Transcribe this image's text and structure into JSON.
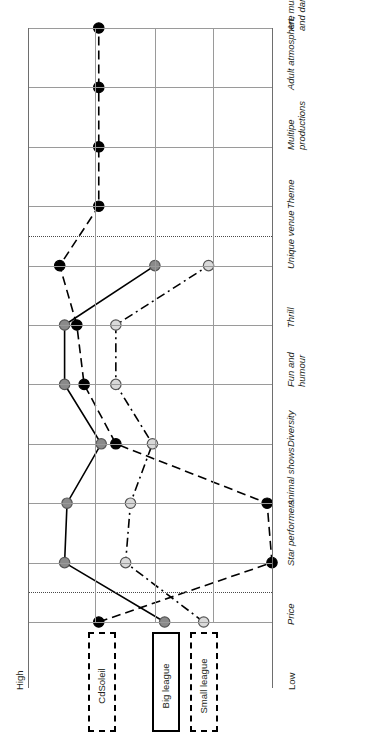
{
  "figure": {
    "axis_low_label": "Low",
    "axis_high_label": "High",
    "orientation": "rotated-90"
  },
  "legend": {
    "items": [
      {
        "label": "CdSoleil",
        "style": "dashed",
        "marker": "black",
        "color": "#000000"
      },
      {
        "label": "Big league",
        "style": "solid",
        "marker": "grey",
        "color": "#8a8a8a"
      },
      {
        "label": "Small league",
        "style": "dash-dot",
        "marker": "lightgrey",
        "color": "#d9d9d9"
      }
    ]
  },
  "chart_data": {
    "type": "line",
    "title": "",
    "xlabel": "",
    "ylabel": "",
    "axis_labels": [
      "High",
      "Low"
    ],
    "grid": true,
    "legend_position": "bottom",
    "categories": [
      "Price",
      "Star performers",
      "Animal shows",
      "Diversity",
      "Fun and humour",
      "Thrill",
      "Unique venue",
      "Theme",
      "Multipe productions",
      "Adult atmosphere",
      "Art, music and dance"
    ],
    "scale": {
      "min": 0,
      "max": 10,
      "note": "0 = High (left edge), 10 = Low (right edge)"
    },
    "series": [
      {
        "name": "CdSoleil",
        "color": "#000000",
        "marker": "filled-black",
        "line_style": "dashed",
        "values": [
          2.9,
          10.0,
          9.8,
          3.6,
          2.3,
          2.0,
          1.3,
          2.9,
          2.9,
          2.9,
          2.9
        ]
      },
      {
        "name": "Big league",
        "color": "#8a8a8a",
        "marker": "filled-grey",
        "line_style": "solid",
        "values": [
          5.6,
          1.5,
          1.6,
          3.0,
          1.5,
          1.5,
          5.2,
          null,
          null,
          null,
          null
        ]
      },
      {
        "name": "Small league",
        "color": "#d9d9d9",
        "marker": "open-lightgrey",
        "line_style": "dash-dot",
        "values": [
          7.2,
          4.0,
          4.2,
          5.1,
          3.6,
          3.6,
          7.4,
          null,
          null,
          null,
          null
        ]
      }
    ]
  }
}
